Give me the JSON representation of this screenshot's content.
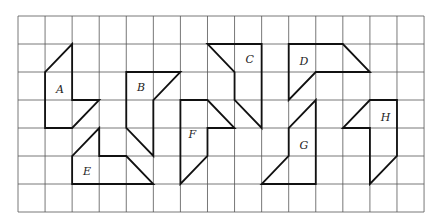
{
  "grid": {
    "columns": 15,
    "rows": 7,
    "origin_px": [
      18,
      16
    ],
    "cell_px": [
      27.07,
      28
    ],
    "line_color": "#555555"
  },
  "shapes": [
    {
      "label": "A",
      "vertices": [
        [
          2,
          1
        ],
        [
          2,
          3
        ],
        [
          3,
          3
        ],
        [
          2,
          4
        ],
        [
          1,
          4
        ],
        [
          1,
          2
        ]
      ],
      "label_pos": [
        1.4,
        2.6
      ]
    },
    {
      "label": "B",
      "vertices": [
        [
          4,
          2
        ],
        [
          6,
          2
        ],
        [
          5,
          3
        ],
        [
          5,
          5
        ],
        [
          4,
          4
        ]
      ],
      "label_pos": [
        4.4,
        2.55
      ]
    },
    {
      "label": "C",
      "vertices": [
        [
          7,
          1
        ],
        [
          9,
          1
        ],
        [
          9,
          4
        ],
        [
          8,
          3
        ],
        [
          8,
          2
        ]
      ],
      "label_pos": [
        8.4,
        1.55
      ]
    },
    {
      "label": "D",
      "vertices": [
        [
          10,
          1
        ],
        [
          12,
          1
        ],
        [
          13,
          2
        ],
        [
          11,
          2
        ],
        [
          10,
          3
        ]
      ],
      "label_pos": [
        10.4,
        1.6
      ]
    },
    {
      "label": "E",
      "vertices": [
        [
          3,
          4
        ],
        [
          3,
          5
        ],
        [
          4,
          5
        ],
        [
          5,
          6
        ],
        [
          2,
          6
        ],
        [
          2,
          5
        ]
      ],
      "label_pos": [
        2.4,
        5.55
      ]
    },
    {
      "label": "F",
      "vertices": [
        [
          6,
          3
        ],
        [
          7,
          3
        ],
        [
          8,
          4
        ],
        [
          7,
          4
        ],
        [
          7,
          5
        ],
        [
          6,
          6
        ]
      ],
      "label_pos": [
        6.3,
        4.2
      ]
    },
    {
      "label": "G",
      "vertices": [
        [
          11,
          3
        ],
        [
          11,
          6
        ],
        [
          9,
          6
        ],
        [
          10,
          5
        ],
        [
          10,
          4
        ]
      ],
      "label_pos": [
        10.4,
        4.6
      ]
    },
    {
      "label": "H",
      "vertices": [
        [
          13,
          3
        ],
        [
          14,
          3
        ],
        [
          14,
          5
        ],
        [
          13,
          6
        ],
        [
          13,
          4
        ],
        [
          12,
          4
        ]
      ],
      "label_pos": [
        13.4,
        3.6
      ]
    }
  ],
  "shape_color": "#111111"
}
